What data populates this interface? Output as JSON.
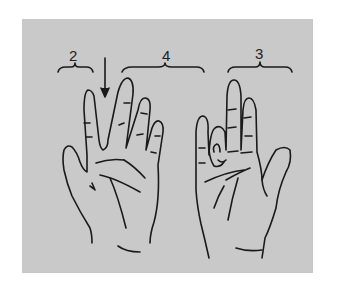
{
  "figure": {
    "background_color": "#c9c9c9",
    "line_color": "#1a1a1a",
    "labels": [
      {
        "id": "group-2",
        "text": "2"
      },
      {
        "id": "group-4",
        "text": "4"
      },
      {
        "id": "group-3",
        "text": "3"
      }
    ],
    "hands": [
      {
        "id": "left-hand",
        "description": "open palm with index finger separated from middle finger, arrow pointing to gap"
      },
      {
        "id": "right-hand",
        "description": "palm with ring and little fingers curled, index and middle fingers extended"
      }
    ]
  }
}
